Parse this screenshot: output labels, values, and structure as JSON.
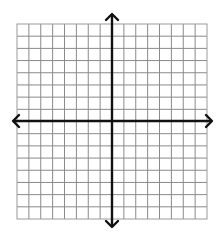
{
  "diagram": {
    "type": "coordinate-grid",
    "grid": {
      "columns": 16,
      "rows": 16,
      "left": 17,
      "top": 24,
      "right": 207,
      "bottom": 219,
      "line_color": "#8a8a8a",
      "border_color": "#9a9a9a"
    },
    "axes": {
      "origin_x": 112,
      "origin_y": 121,
      "x_axis": {
        "from": 13,
        "to": 212,
        "arrows": [
          "left",
          "right"
        ]
      },
      "y_axis": {
        "from": 14,
        "to": 227,
        "arrows": [
          "up",
          "down"
        ]
      },
      "color": "#111111",
      "width": 2.4
    },
    "background": "#ffffff"
  }
}
